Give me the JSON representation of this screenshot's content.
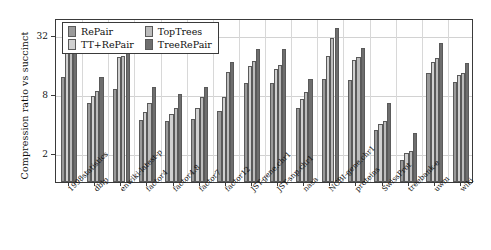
{
  "chart_data": {
    "type": "bar",
    "title": "",
    "xlabel": "",
    "ylabel": "Compression ratio vs succinct",
    "yscale": "log2",
    "ylim": [
      1,
      48
    ],
    "yticks": [
      2,
      8,
      32
    ],
    "ytick_labels": [
      "2",
      "8",
      "32"
    ],
    "grid": true,
    "legend_position": "top-left-inside",
    "categories": [
      "1998statistics",
      "dblp",
      "enwiki-latest-p",
      "factor4",
      "factor4.8",
      "factor7",
      "factor12",
      "JST-gene.chr1",
      "JST-snp.chr1",
      "nasa",
      "NCBI-gene.chr1",
      "proteins",
      "SwissProt",
      "treebank-e",
      "uwm",
      "wiki"
    ],
    "series": [
      {
        "name": "RePair",
        "color": "#9a9a9a",
        "values": [
          12.0,
          6.4,
          9.0,
          4.3,
          4.2,
          4.4,
          5.3,
          10.3,
          10.3,
          5.8,
          11.5,
          11.0,
          3.4,
          1.7,
          13.0,
          10.5
        ]
      },
      {
        "name": "TT+RePair",
        "color": "#d0d0d0",
        "values": [
          23.5,
          7.6,
          19.0,
          5.2,
          5.0,
          5.8,
          7.4,
          15.5,
          14.5,
          7.1,
          19.5,
          18.0,
          3.9,
          2.0,
          17.0,
          12.5
        ]
      },
      {
        "name": "TopTrees",
        "color": "#bcbcbc",
        "values": [
          21.5,
          8.5,
          19.5,
          6.4,
          5.8,
          7.5,
          13.5,
          17.5,
          16.0,
          8.4,
          30.0,
          19.0,
          4.2,
          2.1,
          18.5,
          13.0
        ]
      },
      {
        "name": "TreeRePair",
        "color": "#6e6e6e",
        "values": [
          29.0,
          12.0,
          23.0,
          9.5,
          8.0,
          9.5,
          17.0,
          23.0,
          23.0,
          11.5,
          38.0,
          23.5,
          6.4,
          3.2,
          26.5,
          16.5
        ]
      }
    ]
  },
  "legend": {
    "entries": [
      {
        "label": "RePair",
        "swatch": "#9a9a9a"
      },
      {
        "label": "TopTrees",
        "swatch": "#bcbcbc"
      },
      {
        "label": "TT+RePair",
        "swatch": "#d0d0d0"
      },
      {
        "label": "TreeRePair",
        "swatch": "#6e6e6e"
      }
    ]
  },
  "axes": {
    "y_title": "Compression ratio vs succinct"
  }
}
